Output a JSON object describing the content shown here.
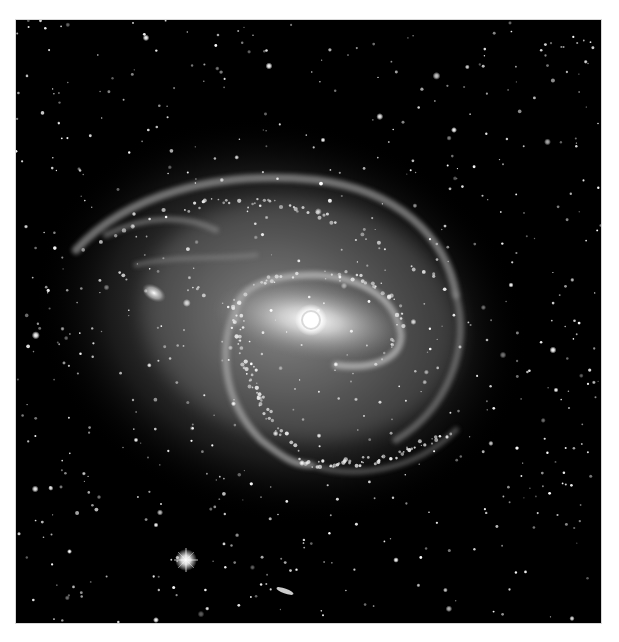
{
  "image": {
    "subject": "barred spiral galaxy",
    "palette": "grayscale",
    "colors": {
      "background": "#000000",
      "frame": "#ffffff",
      "core": "#ffffff",
      "halo": "#8a8a8a"
    }
  },
  "objects": [
    {
      "name": "galaxy-core",
      "cx": 295,
      "cy": 300
    },
    {
      "name": "companion-galaxy",
      "cx": 138,
      "cy": 273
    },
    {
      "name": "bright-star",
      "cx": 170,
      "cy": 540
    },
    {
      "name": "edge-on-galaxy",
      "cx": 269,
      "cy": 571
    }
  ]
}
